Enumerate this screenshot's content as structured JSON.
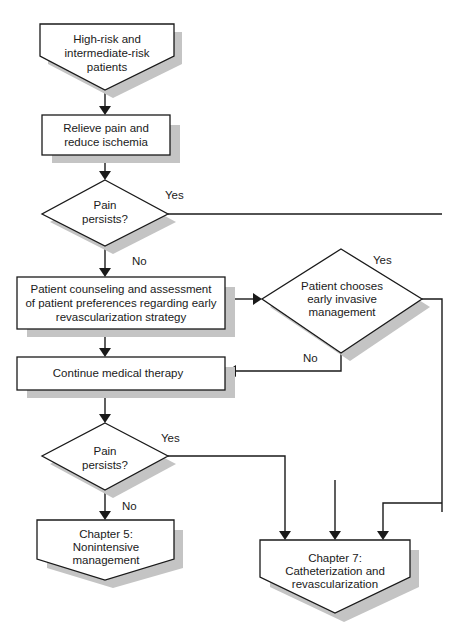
{
  "diagram": {
    "type": "flowchart",
    "colors": {
      "stroke": "#1a1a1a",
      "shadow": "#c4c4c4",
      "fill": "#ffffff"
    },
    "nodes": {
      "start": {
        "shape": "offpage-pentagon",
        "lines": [
          "High-risk and",
          "intermediate-risk",
          "patients"
        ]
      },
      "relieve": {
        "shape": "rectangle",
        "lines": [
          "Relieve pain and",
          "reduce ischemia"
        ]
      },
      "decision1": {
        "shape": "diamond",
        "lines": [
          "Pain",
          "persists?"
        ]
      },
      "counseling": {
        "shape": "rectangle",
        "lines": [
          "Patient counseling and assessment",
          "of patient preferences regarding early",
          "revascularization strategy"
        ]
      },
      "decision2": {
        "shape": "diamond",
        "lines": [
          "Patient chooses",
          "early invasive",
          "management"
        ]
      },
      "continue": {
        "shape": "rectangle",
        "lines": [
          "Continue medical therapy"
        ]
      },
      "decision3": {
        "shape": "diamond",
        "lines": [
          "Pain",
          "persists?"
        ]
      },
      "chapter5": {
        "shape": "offpage-pentagon",
        "lines": [
          "Chapter 5:",
          "Nonintensive",
          "management"
        ]
      },
      "chapter7": {
        "shape": "offpage-pentagon",
        "lines": [
          "Chapter 7:",
          "Catheterization and",
          "revascularization"
        ]
      }
    },
    "edge_labels": {
      "d1_yes": "Yes",
      "d1_no": "No",
      "d2_yes": "Yes",
      "d2_no": "No",
      "d3_yes": "Yes",
      "d3_no": "No"
    },
    "edges": [
      {
        "from": "start",
        "to": "relieve"
      },
      {
        "from": "relieve",
        "to": "decision1"
      },
      {
        "from": "decision1",
        "to": "chapter7",
        "label": "Yes",
        "note": "continues off right edge"
      },
      {
        "from": "decision1",
        "to": "counseling",
        "label": "No"
      },
      {
        "from": "counseling",
        "to": "decision2"
      },
      {
        "from": "counseling",
        "to": "continue"
      },
      {
        "from": "decision2",
        "to": "chapter7",
        "label": "Yes"
      },
      {
        "from": "decision2",
        "to": "continue",
        "label": "No"
      },
      {
        "from": "continue",
        "to": "decision3"
      },
      {
        "from": "decision3",
        "to": "chapter7",
        "label": "Yes"
      },
      {
        "from": "decision3",
        "to": "chapter5",
        "label": "No"
      }
    ]
  }
}
